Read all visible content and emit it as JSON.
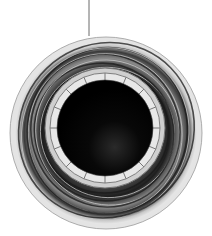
{
  "image": {
    "subject": "circular ring structure with dark central opening and swirling outer bands",
    "palette": {
      "background": "#ffffff",
      "outer_rim": "#d8d8d8",
      "bands_dark": "#2a2a2a",
      "bands_light": "#bdbdbd",
      "inner_ring": "#cfcfcf",
      "center": "#000000",
      "pointer_line": "#444444"
    },
    "inner_ring_segments": 16,
    "outer_band_count": 9
  }
}
